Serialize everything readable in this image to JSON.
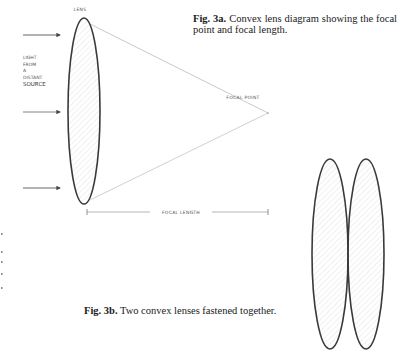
{
  "fig3a": {
    "caption_label": "Fig. 3a.",
    "caption_text": "Convex lens diagram showing the focal point and focal length.",
    "lens_label": "LENS",
    "source_label_lines": [
      "LIGHT",
      "FROM",
      "A",
      "DISTANT",
      "SOURCE"
    ],
    "focal_point_label": "FOCAL POINT",
    "focal_length_label": "FOCAL LENGTH",
    "incoming_rays": 3
  },
  "fig3b": {
    "caption_label": "Fig. 3b.",
    "caption_text": "Two convex lenses fastened together.",
    "lens_count": 2
  },
  "colors": {
    "ink": "#333333",
    "faint_line": "#bbbbbb",
    "lens_fill": "#f1f1f1"
  }
}
